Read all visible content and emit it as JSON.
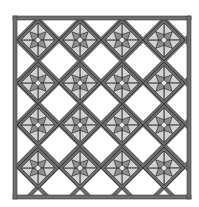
{
  "quilt": {
    "title": "",
    "rows": 4,
    "cols": 4,
    "block_centers_x": [
      38,
      80,
      122,
      164
    ],
    "block_centers_y": [
      40,
      83,
      125,
      168
    ],
    "block_half_diagonal": 21,
    "frame": {
      "x": 13,
      "y": 16,
      "width": 178,
      "height": 183,
      "thickness": 4
    },
    "colors": {
      "background": "#ffffff",
      "frame": "#6e6e6e",
      "frame_edge": "#3a3a3a",
      "sashing": "#6a6a6a",
      "outline": "#2e2e2e",
      "star_dark": "#8c8c8c",
      "star_light": "#d2d2d2",
      "center": "#e6e6e6"
    }
  }
}
